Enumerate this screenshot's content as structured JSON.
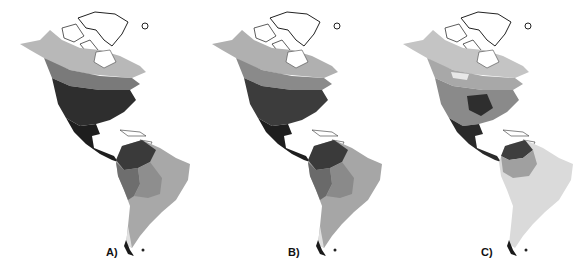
{
  "figure": {
    "panels": [
      {
        "label": "A)",
        "shades": {
          "arctic": "#ffffff",
          "north": "#b8b8b8",
          "mid": "#7a7a7a",
          "temperate": "#2e2e2e",
          "central": "#1e1e1e",
          "sa_north": "#3a3a3a",
          "sa_west": "#6e6e6e",
          "sa_mid": "#8e8e8e",
          "sa_east": "#a8a8a8",
          "sa_south": "#b4b4b4",
          "patagonia": "#e0e0e0"
        }
      },
      {
        "label": "B)",
        "shades": {
          "arctic": "#ffffff",
          "north": "#b0b0b0",
          "mid": "#8a8a8a",
          "temperate": "#3c3c3c",
          "central": "#1e1e1e",
          "sa_north": "#3a3a3a",
          "sa_west": "#6a6a6a",
          "sa_mid": "#8a8a8a",
          "sa_east": "#a6a6a6",
          "sa_south": "#b0b0b0",
          "patagonia": "#e0e0e0"
        }
      },
      {
        "label": "C)",
        "shades": {
          "arctic": "#ffffff",
          "north": "#c4c4c4",
          "mid": "#a8a8a8",
          "temperate": "#8a8a8a",
          "central": "#2a2a2a",
          "sa_north": "#3e3e3e",
          "sa_west": "#a0a0a0",
          "sa_mid": "#bcbcbc",
          "sa_east": "#dadada",
          "sa_south": "#dcdcdc",
          "patagonia": "#e4e4e4"
        }
      }
    ]
  }
}
